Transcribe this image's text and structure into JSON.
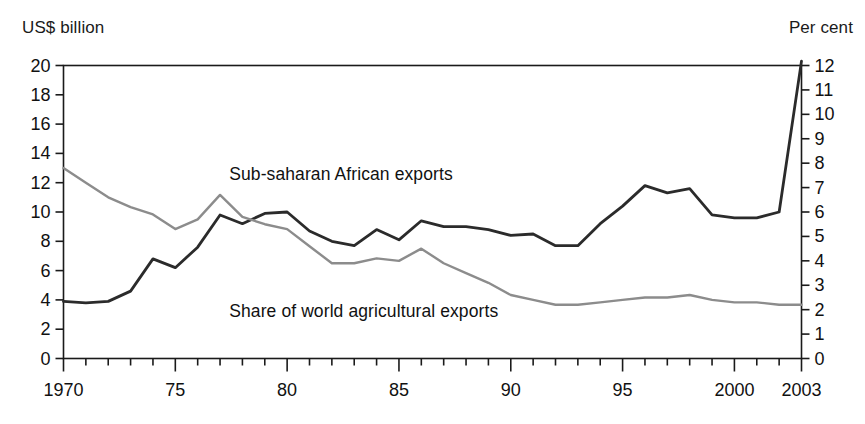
{
  "chart_data": {
    "type": "line",
    "title": "",
    "subtitle": "",
    "xlabel": "",
    "ylabel": "US$ billion",
    "y2label": "Per cent",
    "grid": false,
    "legend_position": "inline-annotation",
    "x": [
      1970,
      1971,
      1972,
      1973,
      1974,
      1975,
      1976,
      1977,
      1978,
      1979,
      1980,
      1981,
      1982,
      1983,
      1984,
      1985,
      1986,
      1987,
      1988,
      1989,
      1990,
      1991,
      1992,
      1993,
      1994,
      1995,
      1996,
      1997,
      1998,
      1999,
      2000,
      2001,
      2002,
      2003
    ],
    "xlim": [
      1970,
      2003
    ],
    "xticks": [
      1970,
      1975,
      1980,
      1985,
      1990,
      1995,
      2000,
      2003
    ],
    "xticklabels": [
      "1970",
      "75",
      "80",
      "85",
      "90",
      "95",
      "2000",
      "2003"
    ],
    "ylim": [
      0,
      20
    ],
    "yticks": [
      0,
      2,
      4,
      6,
      8,
      10,
      12,
      14,
      16,
      18,
      20
    ],
    "yticklabels": [
      "0",
      "2",
      "4",
      "6",
      "8",
      "10",
      "12",
      "14",
      "16",
      "18",
      "20"
    ],
    "y2lim": [
      0,
      12
    ],
    "y2ticks": [
      0,
      1,
      2,
      3,
      4,
      5,
      6,
      7,
      8,
      9,
      10,
      11,
      12
    ],
    "y2ticklabels": [
      "0",
      "1",
      "2",
      "3",
      "4",
      "5",
      "6",
      "7",
      "8",
      "9",
      "10",
      "11",
      "12"
    ],
    "series": [
      {
        "name": "Sub-saharan African exports",
        "axis": "left",
        "unit": "US$ billion",
        "color": "#2b2b2b",
        "label_x": 1983,
        "label_y": 12.6,
        "values": [
          3.9,
          3.8,
          3.9,
          4.6,
          6.8,
          6.2,
          7.6,
          9.8,
          9.2,
          9.9,
          10.0,
          8.7,
          8.0,
          7.7,
          8.8,
          8.1,
          9.4,
          9.0,
          9.0,
          8.8,
          8.4,
          8.5,
          7.7,
          7.7,
          9.2,
          10.4,
          11.8,
          11.3,
          11.6,
          9.8,
          9.6,
          9.6,
          10.0,
          20.3
        ]
      },
      {
        "name": "Share of world agricultural exports",
        "axis": "right",
        "unit": "Per cent",
        "color": "#8c8c8c",
        "label_x": 1983,
        "label_y": 1.95,
        "values": [
          7.8,
          7.2,
          6.6,
          6.2,
          5.9,
          5.3,
          5.7,
          6.7,
          5.8,
          5.5,
          5.3,
          4.6,
          3.9,
          3.9,
          4.1,
          4.0,
          4.5,
          3.9,
          3.5,
          3.1,
          2.6,
          2.4,
          2.2,
          2.2,
          2.3,
          2.4,
          2.5,
          2.5,
          2.6,
          2.4,
          2.3,
          2.3,
          2.2,
          2.2
        ]
      }
    ]
  },
  "labels": {
    "left_axis_title": "US$ billion",
    "right_axis_title": "Per cent",
    "series_one": "Sub-saharan African exports",
    "series_two": "Share of world agricultural exports"
  }
}
